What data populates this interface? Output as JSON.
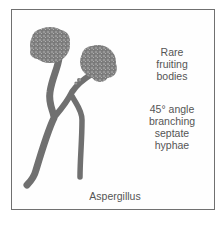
{
  "figure": {
    "title": "Aspergillus",
    "annotations": [
      {
        "id": "fruiting",
        "lines": [
          "Rare",
          "fruiting",
          "bodies"
        ]
      },
      {
        "id": "branching",
        "lines": [
          "45° angle",
          "branching",
          "septate",
          "hyphae"
        ]
      }
    ],
    "colors": {
      "hyphae": "#6e6e6e",
      "conidia": "#8a8a8a",
      "border": "#707070",
      "text": "#555555"
    }
  }
}
